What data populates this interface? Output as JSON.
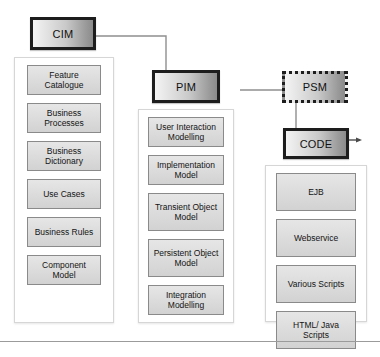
{
  "diagram": {
    "colors": {
      "stage_border": "#1d1d1d",
      "stage_fill_light": "#f4f4f4",
      "stage_fill_dark": "#8b8b8b",
      "item_fill": "#dcdcdc",
      "item_border": "#8a8a8a",
      "panel_border": "#d6d6d6",
      "connector": "#8f8f8f",
      "page_background": "#ffffff"
    }
  },
  "stages": {
    "cim": {
      "label": "CIM",
      "border_style": "solid"
    },
    "pim": {
      "label": "PIM",
      "border_style": "solid"
    },
    "psm": {
      "label": "PSM",
      "border_style": "dotted"
    },
    "code": {
      "label": "CODE",
      "border_style": "solid"
    }
  },
  "panels": {
    "cim": {
      "name": "cim-artefacts",
      "items": [
        {
          "label": "Feature Catalogue"
        },
        {
          "label": "Business Processes"
        },
        {
          "label": "Business Dictionary"
        },
        {
          "label": "Use Cases"
        },
        {
          "label": "Business Rules"
        },
        {
          "label": "Component Model"
        }
      ]
    },
    "pim": {
      "name": "pim-artefacts",
      "items": [
        {
          "label": "User Interaction Modelling"
        },
        {
          "label": "Implementation Model"
        },
        {
          "label": "Transient Object Model"
        },
        {
          "label": "Persistent Object Model"
        },
        {
          "label": "Integration Modelling"
        }
      ]
    },
    "code": {
      "name": "code-artefacts",
      "items": [
        {
          "label": "EJB"
        },
        {
          "label": "Webservice"
        },
        {
          "label": "Various Scripts"
        },
        {
          "label": "HTML/ Java Scripts"
        }
      ]
    }
  },
  "connectors": [
    {
      "name": "cim-to-pim",
      "from": "CIM",
      "to": "PIM",
      "arrow": true
    },
    {
      "name": "pim-to-psm",
      "from": "PIM",
      "to": "PSM",
      "arrow": false
    },
    {
      "name": "psm-to-code",
      "from": "PSM",
      "to": "CODE",
      "arrow": true
    }
  ],
  "caption": {
    "text": ""
  }
}
